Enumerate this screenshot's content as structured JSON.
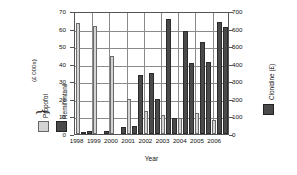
{
  "chart_data": {
    "type": "bar",
    "title": "",
    "xlabel": "Year",
    "ylabel_left": "(£ 000s)",
    "ylabel_right": "Clonidine (£)",
    "categories": [
      "1998",
      "1999",
      "2000",
      "2001",
      "2002",
      "2003",
      "2004",
      "2005",
      "2006"
    ],
    "ylim_left": [
      0,
      70
    ],
    "ylim_right": [
      0,
      700
    ],
    "yticks_left": [
      "0",
      "10",
      "20",
      "30",
      "40",
      "50",
      "60",
      "70"
    ],
    "yticks_right": [
      "0",
      "100",
      "200",
      "300",
      "400",
      "500",
      "600",
      "700"
    ],
    "grid": true,
    "legend_position": "left and right outside",
    "series": [
      {
        "name": "Propofol",
        "axis": "left",
        "units": "(£ 000s)",
        "color": "#d3d3d3",
        "values": [
          64,
          62.5,
          45,
          20,
          13.5,
          11,
          9.5,
          12,
          8
        ]
      },
      {
        "name": "Remifentanil",
        "axis": "left",
        "units": "(£ 000s)",
        "color": "#4a4a4a",
        "values": [
          0.5,
          0,
          0,
          4.5,
          35.5,
          66.5,
          59.5,
          53.5,
          65
        ]
      },
      {
        "name": "Clonidine",
        "axis": "right",
        "units": "(£)",
        "color": "#4a4a4a",
        "values": [
          15,
          18,
          40,
          340,
          200,
          95,
          412,
          418,
          620
        ]
      }
    ]
  },
  "legend_left": {
    "brace_glyph": "}",
    "units": "(£ 000s)",
    "items": [
      {
        "label": "Propofol",
        "color": "#d3d3d3"
      },
      {
        "label": "Remifentanil",
        "color": "#4a4a4a"
      }
    ]
  },
  "legend_right": {
    "label": "Clonidine (£)",
    "color": "#4a4a4a"
  }
}
